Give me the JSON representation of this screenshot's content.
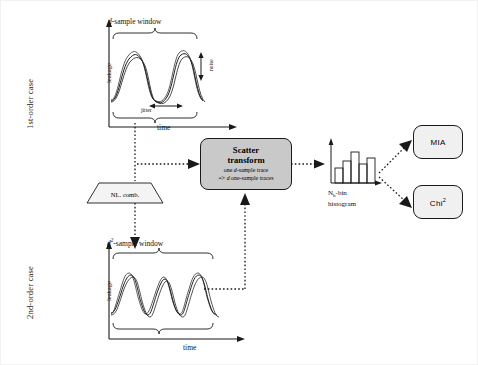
{
  "figure": {
    "title_present": false,
    "rows": [
      {
        "id": "first-order",
        "side_label": "1st-order case",
        "window_label_prefix": "d",
        "window_label_sup": "",
        "window_label_suffix": "-sample window",
        "y_axis_label": "leakage",
        "x_axis_label": "time",
        "annotations": {
          "noise": "noise",
          "jitter": "jitter"
        }
      },
      {
        "id": "second-order",
        "side_label": "2nd-order case",
        "window_label_prefix": "d",
        "window_label_sup": "2",
        "window_label_suffix": "-sample window",
        "y_axis_label": "leakage",
        "x_axis_label": "time",
        "annotations": {}
      }
    ],
    "nl_comb": {
      "label": "NL. comb."
    },
    "scatter_transform": {
      "title_line1": "Scatter",
      "title_line2": "transform",
      "sub_line1_pre": "one ",
      "sub_line1_em": "d",
      "sub_line1_post": "-sample trace",
      "sub_line2_pre": "=> ",
      "sub_line2_em": "d",
      "sub_line2_post": " one-sample traces",
      "fill_color": "#c9c9c9",
      "border_color": "#1a1a1a"
    },
    "histogram": {
      "label_line1_pre": "N",
      "label_line1_sub": "b",
      "label_line1_post": "-bin",
      "label_line2": "histogram",
      "bars": [
        0.42,
        0.62,
        0.88,
        0.54,
        0.7
      ],
      "y_axis": "",
      "x_axis": ""
    },
    "outputs": [
      {
        "id": "mia",
        "label": "MIA",
        "sup": ""
      },
      {
        "id": "chi2",
        "label": "Chi",
        "sup": "2"
      }
    ],
    "colors": {
      "line": "#1a1a1a",
      "dotted": "#1a1a1a",
      "box_fill": "#c9c9c9",
      "out_fill": "#f0f0f0",
      "background": "#ffffff"
    }
  }
}
